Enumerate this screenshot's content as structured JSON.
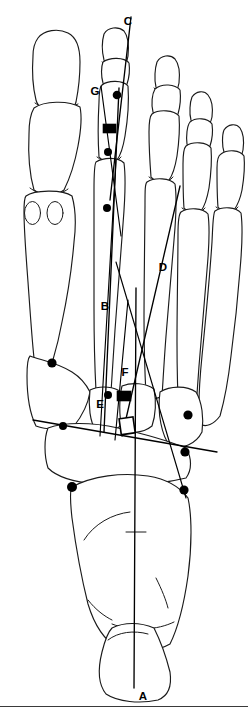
{
  "figure": {
    "view": "dorsoplantar",
    "line_color": "#1a1a1a",
    "marker_color": "#000000",
    "background": "#ffffff"
  },
  "labels": [
    {
      "id": "A",
      "text": "A",
      "x": 143,
      "y": 697,
      "meaning": "longitudinal-axis-of-foot"
    },
    {
      "id": "B",
      "text": "B",
      "x": 105,
      "y": 307,
      "meaning": "second-metatarsal-axis"
    },
    {
      "id": "C",
      "text": "C",
      "x": 128,
      "y": 22,
      "meaning": "proximal-phalanx-axis"
    },
    {
      "id": "D",
      "text": "D",
      "x": 163,
      "y": 268,
      "meaning": "lateral-reference-axis"
    },
    {
      "id": "E",
      "text": "E",
      "x": 100,
      "y": 405,
      "meaning": "tarsometatarsal-reference"
    },
    {
      "id": "F",
      "text": "F",
      "x": 125,
      "y": 373,
      "meaning": "metatarsal-base-angle"
    },
    {
      "id": "G",
      "text": "G",
      "x": 95,
      "y": 92,
      "meaning": "distal-phalanx-axis"
    }
  ],
  "reference_points": [
    {
      "name": "distal-phalanx-point",
      "x": 117,
      "y": 95
    },
    {
      "name": "proximal-phalanx-distal-point",
      "x": 108,
      "y": 150
    },
    {
      "name": "metatarsal-head-point",
      "x": 107,
      "y": 208
    },
    {
      "name": "first-metatarsal-head-point",
      "x": 52,
      "y": 363
    },
    {
      "name": "second-metatarsal-base-point",
      "x": 108,
      "y": 395
    },
    {
      "name": "first-metatarsal-base-point",
      "x": 63,
      "y": 426
    },
    {
      "name": "cuboid-point",
      "x": 188,
      "y": 415
    },
    {
      "name": "lateral-midfoot-point",
      "x": 185,
      "y": 452
    },
    {
      "name": "lateral-hindfoot-point",
      "x": 184,
      "y": 490
    },
    {
      "name": "navicular-point",
      "x": 72,
      "y": 487
    }
  ],
  "angle_markers": [
    {
      "name": "phalangeal-angle-block",
      "type": "filled-rect",
      "x": 103,
      "y": 124,
      "w": 13,
      "h": 9
    },
    {
      "name": "metatarsal-angle-block",
      "type": "filled-rect",
      "x": 117,
      "y": 391,
      "w": 14,
      "h": 10
    },
    {
      "name": "tarsal-angle-square",
      "type": "open-square",
      "x": 120,
      "y": 418,
      "w": 14,
      "h": 16
    }
  ],
  "axes": [
    {
      "id": "A",
      "name": "longitudinal-foot-axis",
      "x1": 136,
      "y1": 300,
      "x2": 136,
      "y2": 690
    },
    {
      "id": "B",
      "name": "second-metatarsal-axis",
      "x1": 119,
      "y1": 88,
      "x2": 105,
      "y2": 430
    },
    {
      "id": "C",
      "name": "proximal-phalanx-axis",
      "x1": 130,
      "y1": 18,
      "x2": 112,
      "y2": 196
    },
    {
      "id": "D",
      "name": "lateral-oblique-axis",
      "x1": 178,
      "y1": 188,
      "x2": 124,
      "y2": 430
    },
    {
      "id": "E",
      "name": "medial-oblique-axis",
      "x1": 114,
      "y1": 165,
      "x2": 103,
      "y2": 435
    },
    {
      "id": "G",
      "name": "distal-phalanx-axis",
      "x1": 103,
      "y1": 86,
      "x2": 117,
      "y2": 200
    },
    {
      "id": "T",
      "name": "transverse-tarsal-line",
      "x1": 33,
      "y1": 420,
      "x2": 217,
      "y2": 452
    }
  ],
  "footer": {
    "rule": true
  }
}
